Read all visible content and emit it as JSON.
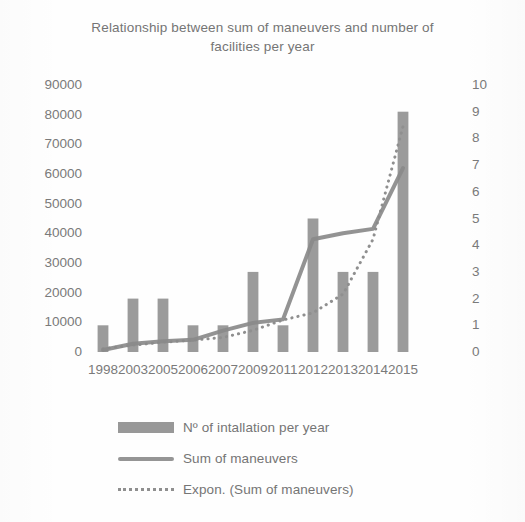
{
  "chart_data": {
    "type": "bar",
    "title": "Relationship between sum of maneuvers and number of facilities per year",
    "title_line1": "Relationship between sum of maneuvers and number of",
    "title_line2": "facilities per year",
    "xlabel": "",
    "ylabel": "",
    "grid": false,
    "legend_position": "bottom",
    "categories": [
      "1998",
      "2003",
      "2005",
      "2006",
      "2007",
      "2009",
      "2011",
      "2012",
      "2013",
      "2014",
      "2015"
    ],
    "y_left": {
      "label": "",
      "ylim": [
        0,
        90000
      ],
      "ticks": [
        "0",
        "10000",
        "20000",
        "30000",
        "40000",
        "50000",
        "60000",
        "70000",
        "80000",
        "90000"
      ],
      "tick_values": [
        0,
        10000,
        20000,
        30000,
        40000,
        50000,
        60000,
        70000,
        80000,
        90000
      ]
    },
    "y_right": {
      "label": "",
      "ylim": [
        0,
        10
      ],
      "ticks": [
        "0",
        "1",
        "2",
        "3",
        "4",
        "5",
        "6",
        "7",
        "8",
        "9",
        "10"
      ],
      "tick_values": [
        0,
        1,
        2,
        3,
        4,
        5,
        6,
        7,
        8,
        9,
        10
      ]
    },
    "series": [
      {
        "name": "Nº of intallation per year",
        "type": "bar",
        "axis": "right",
        "color": "#8a8a8a",
        "values": [
          1,
          2,
          2,
          1,
          1,
          3,
          1,
          5,
          3,
          3,
          9
        ]
      },
      {
        "name": "Sum of maneuvers",
        "type": "line",
        "axis": "left",
        "color": "#8a8a8a",
        "values": [
          700,
          2800,
          3600,
          4100,
          7200,
          9800,
          11000,
          38000,
          40000,
          41500,
          62000
        ]
      },
      {
        "name": "Expon. (Sum of maneuvers)",
        "type": "line",
        "style": "dotted",
        "axis": "left",
        "color": "#8f8f8f",
        "values": [
          1100,
          2300,
          3300,
          4000,
          4900,
          7300,
          10800,
          13200,
          19500,
          38000,
          76000
        ]
      }
    ]
  },
  "legend": {
    "items": [
      {
        "label": "Nº of intallation per year",
        "swatch": "bar-swatch"
      },
      {
        "label": "Sum of maneuvers",
        "swatch": "line-swatch"
      },
      {
        "label": "Expon. (Sum of maneuvers)",
        "swatch": "dotted-swatch"
      }
    ]
  }
}
